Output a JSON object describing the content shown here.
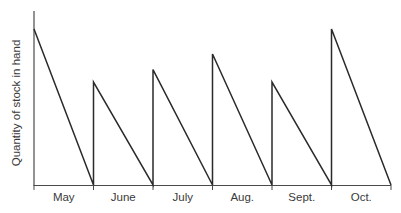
{
  "chart_data": {
    "type": "line",
    "title": "",
    "xlabel": "",
    "ylabel": "Quantity of stock in hand",
    "categories": [
      "May",
      "June",
      "July",
      "Aug.",
      "Sept.",
      "Oct."
    ],
    "series": [
      {
        "name": "Stock level (sawtooth: restocked at start of each month, depleted to zero by month end)",
        "peak_values": [
          100,
          66,
          74,
          84,
          66,
          100
        ],
        "end_values": [
          0,
          0,
          0,
          0,
          0,
          0
        ]
      }
    ],
    "ylim": [
      0,
      100
    ],
    "y_ticks": "none (unlabeled axis, relative scale)",
    "grid": false,
    "legend": "none",
    "line_color": "#2a2a2a"
  },
  "axes": {
    "ylabel": "Quantity of stock in hand",
    "months": [
      "May",
      "June",
      "July",
      "Aug.",
      "Sept.",
      "Oct."
    ]
  }
}
